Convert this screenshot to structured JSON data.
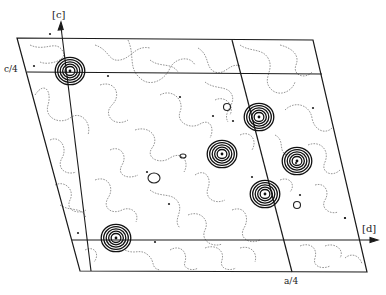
{
  "figure": {
    "type": "electron density projection map",
    "background": "#ffffff",
    "line_color": "#1a1a1a",
    "contour_color": "#8a8a8a"
  },
  "labels": {
    "c_axis": "[c]",
    "a_axis": "[d]",
    "c_quarter": "c/4",
    "a_quarter": "a/4"
  },
  "geometry": {
    "cell": {
      "tl": [
        17,
        38
      ],
      "tr": [
        313,
        40
      ],
      "br": [
        367,
        272
      ],
      "bl": [
        80,
        271
      ]
    },
    "c_quarter_line": {
      "from": [
        27,
        72
      ],
      "to": [
        322,
        74
      ]
    },
    "a_axis_line": {
      "from": [
        72,
        240
      ],
      "to": [
        378,
        240
      ]
    },
    "c_axis_line": {
      "from": [
        91,
        271
      ],
      "to": [
        61,
        22
      ]
    },
    "a_quarter_line": {
      "from": [
        232,
        40
      ],
      "to": [
        292,
        272
      ]
    }
  },
  "peaks": [
    {
      "id": "peak-1",
      "x": 70,
      "y": 71,
      "rings": 5
    },
    {
      "id": "peak-2",
      "x": 259,
      "y": 117,
      "rings": 5
    },
    {
      "id": "peak-3",
      "x": 222,
      "y": 154,
      "rings": 5
    },
    {
      "id": "peak-4",
      "x": 297,
      "y": 161,
      "rings": 5
    },
    {
      "id": "peak-5",
      "x": 265,
      "y": 194,
      "rings": 5
    },
    {
      "id": "peak-6",
      "x": 116,
      "y": 238,
      "rings": 5
    }
  ],
  "small_contours": [
    {
      "x": 227,
      "y": 107,
      "rx": 3.5,
      "ry": 3.5
    },
    {
      "x": 154,
      "y": 178,
      "rx": 6,
      "ry": 5
    },
    {
      "x": 297,
      "y": 205,
      "rx": 3.5,
      "ry": 3.5
    },
    {
      "x": 183,
      "y": 156,
      "rx": 3,
      "ry": 2
    }
  ],
  "dots": [
    [
      34,
      66
    ],
    [
      108,
      76
    ],
    [
      50,
      34
    ],
    [
      180,
      97
    ],
    [
      147,
      172
    ],
    [
      169,
      204
    ],
    [
      233,
      121
    ],
    [
      313,
      108
    ],
    [
      78,
      233
    ],
    [
      155,
      242
    ],
    [
      296,
      163
    ],
    [
      252,
      177
    ],
    [
      300,
      195
    ],
    [
      345,
      218
    ],
    [
      213,
      116
    ],
    [
      345,
      218
    ]
  ]
}
